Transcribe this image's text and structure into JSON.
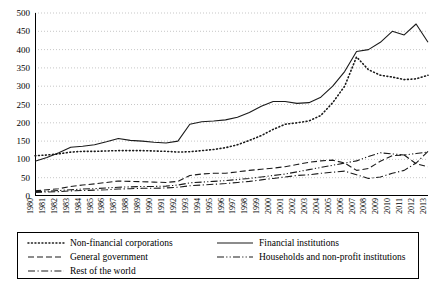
{
  "chart_data": {
    "type": "line",
    "title": "",
    "xlabel": "",
    "ylabel": "",
    "ylim": [
      0,
      500
    ],
    "ytick_step": 50,
    "yticks": [
      0,
      50,
      100,
      150,
      200,
      250,
      300,
      350,
      400,
      450,
      500
    ],
    "grid": true,
    "grid_style": "dotted-horizontal",
    "legend_position": "bottom",
    "categories": [
      "1980",
      "1981",
      "1982",
      "1983",
      "1984",
      "1985",
      "1986",
      "1987",
      "1988",
      "1989",
      "1990",
      "1991",
      "1992",
      "1993",
      "1994",
      "1995",
      "1996",
      "1997",
      "1998",
      "1999",
      "2000",
      "2001",
      "2002",
      "2003",
      "2004",
      "2005",
      "2006",
      "2007",
      "2008",
      "2009",
      "2010",
      "2011",
      "2012",
      "2013"
    ],
    "series": [
      {
        "name": "Non-financial corporations",
        "style": "dotted",
        "values": [
          110,
          112,
          115,
          120,
          122,
          122,
          123,
          124,
          124,
          124,
          123,
          122,
          120,
          121,
          124,
          127,
          132,
          140,
          152,
          165,
          182,
          196,
          200,
          205,
          220,
          255,
          300,
          380,
          345,
          330,
          325,
          318,
          320,
          330
        ]
      },
      {
        "name": "Financial institutions",
        "style": "solid",
        "values": [
          95,
          105,
          118,
          133,
          136,
          140,
          148,
          157,
          152,
          150,
          147,
          145,
          150,
          196,
          203,
          205,
          208,
          215,
          228,
          245,
          258,
          258,
          253,
          255,
          270,
          300,
          340,
          395,
          400,
          420,
          450,
          440,
          470,
          420
        ]
      },
      {
        "name": "General government",
        "style": "dashed",
        "values": [
          14,
          17,
          20,
          26,
          30,
          33,
          37,
          41,
          40,
          39,
          38,
          37,
          40,
          56,
          60,
          62,
          62,
          66,
          70,
          73,
          76,
          80,
          86,
          92,
          96,
          98,
          90,
          70,
          75,
          95,
          110,
          112,
          88,
          80
        ]
      },
      {
        "name": "Households and non-profit institutions",
        "style": "dash-dot-dot",
        "values": [
          12,
          13,
          15,
          17,
          19,
          20,
          22,
          24,
          25,
          26,
          26,
          27,
          30,
          36,
          38,
          40,
          42,
          45,
          48,
          52,
          56,
          60,
          66,
          72,
          78,
          84,
          90,
          96,
          108,
          118,
          115,
          112,
          116,
          120
        ]
      },
      {
        "name": "Rest of the world",
        "style": "dash-dot",
        "values": [
          10,
          11,
          12,
          14,
          15,
          16,
          17,
          19,
          20,
          21,
          21,
          22,
          24,
          28,
          30,
          32,
          34,
          37,
          40,
          44,
          48,
          52,
          56,
          58,
          62,
          65,
          68,
          58,
          48,
          52,
          62,
          70,
          90,
          122
        ]
      }
    ]
  },
  "legend": {
    "items_left": [
      {
        "label": "Non-financial corporations",
        "style": "dotted"
      },
      {
        "label": "General government",
        "style": "dashed"
      },
      {
        "label": "Rest of the world",
        "style": "dash-dot"
      }
    ],
    "items_right": [
      {
        "label": "Financial institutions",
        "style": "solid"
      },
      {
        "label": "Households and non-profit institutions",
        "style": "dash-dot-dot"
      }
    ]
  },
  "colors": {
    "line": "#1a1a1a",
    "grid": "#b9b9b9",
    "axis": "#000000",
    "background": "#ffffff"
  }
}
